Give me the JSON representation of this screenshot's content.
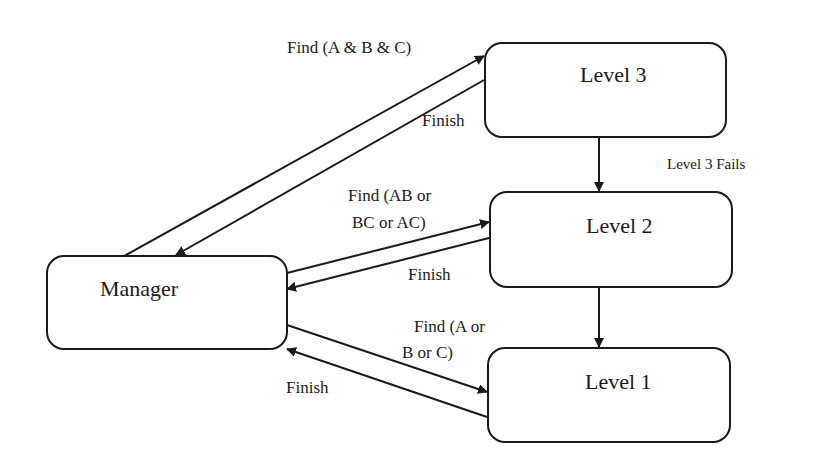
{
  "nodes": {
    "manager": {
      "label": "Manager"
    },
    "level3": {
      "label": "Level 3"
    },
    "level2": {
      "label": "Level 2"
    },
    "level1": {
      "label": "Level 1"
    }
  },
  "edges": {
    "to_level3": {
      "label": "Find (A & B & C)"
    },
    "from_level3": {
      "label": "Finish"
    },
    "to_level2": {
      "line1": "Find (AB or",
      "line2": "BC or AC)"
    },
    "from_level2": {
      "label": "Finish"
    },
    "to_level1": {
      "line1": "Find (A or",
      "line2": "B or C)"
    },
    "from_level1": {
      "label": "Finish"
    },
    "level3_to_level2": {
      "label": "Level 3 Fails"
    }
  }
}
